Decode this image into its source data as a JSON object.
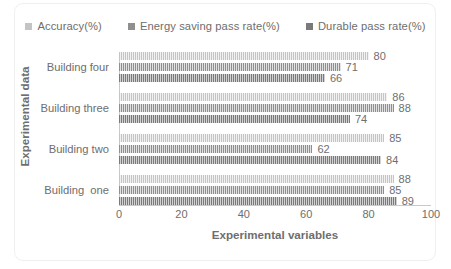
{
  "chart_data": {
    "type": "bar",
    "orientation": "horizontal",
    "title": "",
    "xlabel": "Experimental variables",
    "ylabel": "Experimental data",
    "xlim": [
      0,
      100
    ],
    "xticks": [
      0,
      20,
      40,
      60,
      80,
      100
    ],
    "grid": false,
    "legend_position": "top-center",
    "categories": [
      "Building  one",
      "Building two",
      "Building three",
      "Building four"
    ],
    "series": [
      {
        "name": "Accuracy(%)",
        "color": "#c4c4c4",
        "values": [
          88,
          85,
          86,
          80
        ]
      },
      {
        "name": "Energy saving pass rate(%)",
        "color": "#8f8f8f",
        "values": [
          85,
          62,
          88,
          71
        ]
      },
      {
        "name": "Durable pass rate(%)",
        "color": "#7a7a7a",
        "values": [
          89,
          84,
          74,
          66
        ]
      }
    ]
  }
}
